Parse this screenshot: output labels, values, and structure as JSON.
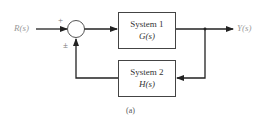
{
  "diagram": {
    "type": "feedback-control-block-diagram",
    "input": {
      "label": "R(s)"
    },
    "output": {
      "label": "Y(s)"
    },
    "summing_junction": {
      "sign_top": "+",
      "sign_bottom": "±"
    },
    "blocks": [
      {
        "name": "System 1",
        "function": "G(s)",
        "path": "forward"
      },
      {
        "name": "System 2",
        "function": "H(s)",
        "path": "feedback"
      }
    ],
    "caption": "(a)",
    "colors": {
      "line": "#222222",
      "label": "#9a9a9a",
      "box_border": "#444444"
    }
  }
}
